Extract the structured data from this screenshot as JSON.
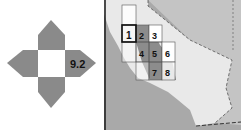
{
  "diagram": {
    "label": "9.2",
    "colors": {
      "arm": "#8a8a8a",
      "center": "#ffffff",
      "text": "#111111"
    }
  },
  "map": {
    "colors": {
      "ocean": "#a9a9a9",
      "state": "#e9e9e9",
      "neighbor": "#c4c4c4",
      "valley": "#8c8c8c",
      "cell": "#ffffff",
      "border": "#333333"
    },
    "grid_cells": [
      {
        "label": "",
        "col": 0,
        "row": -1
      },
      {
        "label": "1",
        "col": 0,
        "row": 0,
        "highlight": true
      },
      {
        "label": "2",
        "col": 1,
        "row": 0
      },
      {
        "label": "3",
        "col": 2,
        "row": 0
      },
      {
        "label": "",
        "col": 0,
        "row": 1
      },
      {
        "label": "4",
        "col": 1,
        "row": 1
      },
      {
        "label": "5",
        "col": 2,
        "row": 1
      },
      {
        "label": "6",
        "col": 3,
        "row": 1
      },
      {
        "label": "",
        "col": 0,
        "row": 2
      },
      {
        "label": "7",
        "col": 2,
        "row": 2
      },
      {
        "label": "8",
        "col": 3,
        "row": 2
      }
    ],
    "labels": {
      "c1": "1",
      "c2": "2",
      "c3": "3",
      "c4": "4",
      "c5": "5",
      "c6": "6",
      "c7": "7",
      "c8": "8"
    }
  }
}
